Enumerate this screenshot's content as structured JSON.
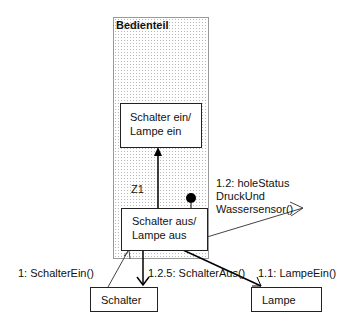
{
  "diagram": {
    "swimlane": {
      "title": "Bedienteil"
    },
    "states": [
      {
        "id": "upper",
        "line1": "Schalter ein/",
        "line2": "Lampe ein"
      },
      {
        "id": "lower",
        "line1": "Schalter aus/",
        "line2": "Lampe aus"
      }
    ],
    "objects": [
      {
        "id": "schalter",
        "label": "Schalter"
      },
      {
        "id": "lampe",
        "label": "Lampe"
      }
    ],
    "transition_label": "Z1",
    "messages": [
      {
        "label": "1: SchalterEin()"
      },
      {
        "label": "1.1: LampeEin()"
      },
      {
        "label_line1": "1.2: holeStatus",
        "label_line2": "DruckUnd",
        "label_line3": "Wassersensor()"
      },
      {
        "label": "1.2.5: SchalterAus()"
      }
    ]
  }
}
